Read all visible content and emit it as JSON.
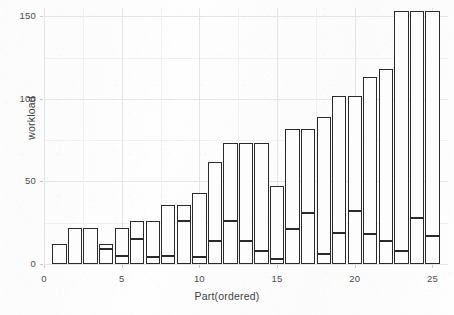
{
  "chart_data": {
    "type": "bar",
    "title": "",
    "subtitle": "",
    "xlabel": "Part(ordered)",
    "ylabel": "workload",
    "stacked": true,
    "grid": true,
    "legend": "none",
    "style": "ggplot2-greyscale",
    "bar_fill": "#fdfdfd",
    "bar_outline": "#2a2a2a",
    "gridline_major_color": "#e4e4e6",
    "gridline_minor_color": "#f0f0f1",
    "xlim": [
      0,
      26
    ],
    "ylim": [
      0,
      155
    ],
    "y_ticks": [
      0,
      50,
      100,
      150
    ],
    "y_tick_labels": [
      "0",
      "50",
      "100",
      "150"
    ],
    "y_minor_ticks": [
      25,
      75,
      125
    ],
    "x_ticks": [
      0,
      5,
      10,
      15,
      20,
      25
    ],
    "x_tick_labels": [
      "0",
      "5",
      "10",
      "15",
      "20",
      "25"
    ],
    "x_minor_ticks": [
      2.5,
      7.5,
      12.5,
      17.5,
      22.5
    ],
    "categories": [
      1,
      2,
      3,
      4,
      5,
      6,
      7,
      8,
      9,
      10,
      11,
      12,
      13,
      14,
      15,
      16,
      17,
      18,
      19,
      20,
      21,
      22,
      23,
      24,
      25
    ],
    "totals": [
      12,
      22,
      22,
      12,
      22,
      26,
      26,
      36,
      36,
      43,
      62,
      73,
      73,
      73,
      47,
      82,
      82,
      89,
      102,
      102,
      113,
      118,
      153,
      153,
      153
    ],
    "note_clipped": "bars 23-25 extend beyond the 150 axis limit and are clipped at the panel top",
    "series": [
      {
        "name": "lower segment",
        "values": [
          12,
          22,
          22,
          9,
          5,
          15,
          4,
          5,
          26,
          4,
          14,
          26,
          14,
          8,
          3,
          21,
          31,
          6,
          19,
          32,
          18,
          14,
          8,
          28,
          17
        ]
      },
      {
        "name": "upper segment",
        "values": [
          0,
          0,
          0,
          3,
          17,
          11,
          22,
          31,
          10,
          39,
          48,
          47,
          59,
          65,
          44,
          61,
          51,
          83,
          83,
          70,
          95,
          104,
          145,
          125,
          136
        ]
      }
    ],
    "bars": [
      {
        "part": 1,
        "total": 12,
        "split": 12
      },
      {
        "part": 2,
        "total": 22,
        "split": 22
      },
      {
        "part": 3,
        "total": 22,
        "split": 22
      },
      {
        "part": 4,
        "total": 12,
        "split": 9
      },
      {
        "part": 5,
        "total": 22,
        "split": 5
      },
      {
        "part": 6,
        "total": 26,
        "split": 15
      },
      {
        "part": 7,
        "total": 26,
        "split": 4
      },
      {
        "part": 8,
        "total": 36,
        "split": 5
      },
      {
        "part": 9,
        "total": 36,
        "split": 26
      },
      {
        "part": 10,
        "total": 43,
        "split": 4
      },
      {
        "part": 11,
        "total": 62,
        "split": 14
      },
      {
        "part": 12,
        "total": 73,
        "split": 26
      },
      {
        "part": 13,
        "total": 73,
        "split": 14
      },
      {
        "part": 14,
        "total": 73,
        "split": 8
      },
      {
        "part": 15,
        "total": 47,
        "split": 3
      },
      {
        "part": 16,
        "total": 82,
        "split": 21
      },
      {
        "part": 17,
        "total": 82,
        "split": 31
      },
      {
        "part": 18,
        "total": 89,
        "split": 6
      },
      {
        "part": 19,
        "total": 102,
        "split": 19
      },
      {
        "part": 20,
        "total": 102,
        "split": 32
      },
      {
        "part": 21,
        "total": 113,
        "split": 18
      },
      {
        "part": 22,
        "total": 118,
        "split": 14
      },
      {
        "part": 23,
        "total": 153,
        "split": 8
      },
      {
        "part": 24,
        "total": 153,
        "split": 28
      },
      {
        "part": 25,
        "total": 153,
        "split": 17
      }
    ]
  }
}
